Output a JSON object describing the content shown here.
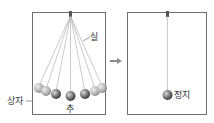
{
  "labels": {
    "string": "실",
    "box": "상자",
    "weight": "추",
    "stopped": "정지"
  },
  "colors": {
    "box_border": "#6e6e6e",
    "string": "#9a9a9a",
    "ball_light": "#b9b9b9",
    "ball_mid": "#8a8a8a",
    "ball_dark": "#555555",
    "arrow": "#8a8a8a"
  },
  "panels": [
    {
      "name": "before",
      "description": "pendulum swinging through multiple positions"
    },
    {
      "name": "after",
      "description": "pendulum at rest hanging vertically"
    }
  ]
}
